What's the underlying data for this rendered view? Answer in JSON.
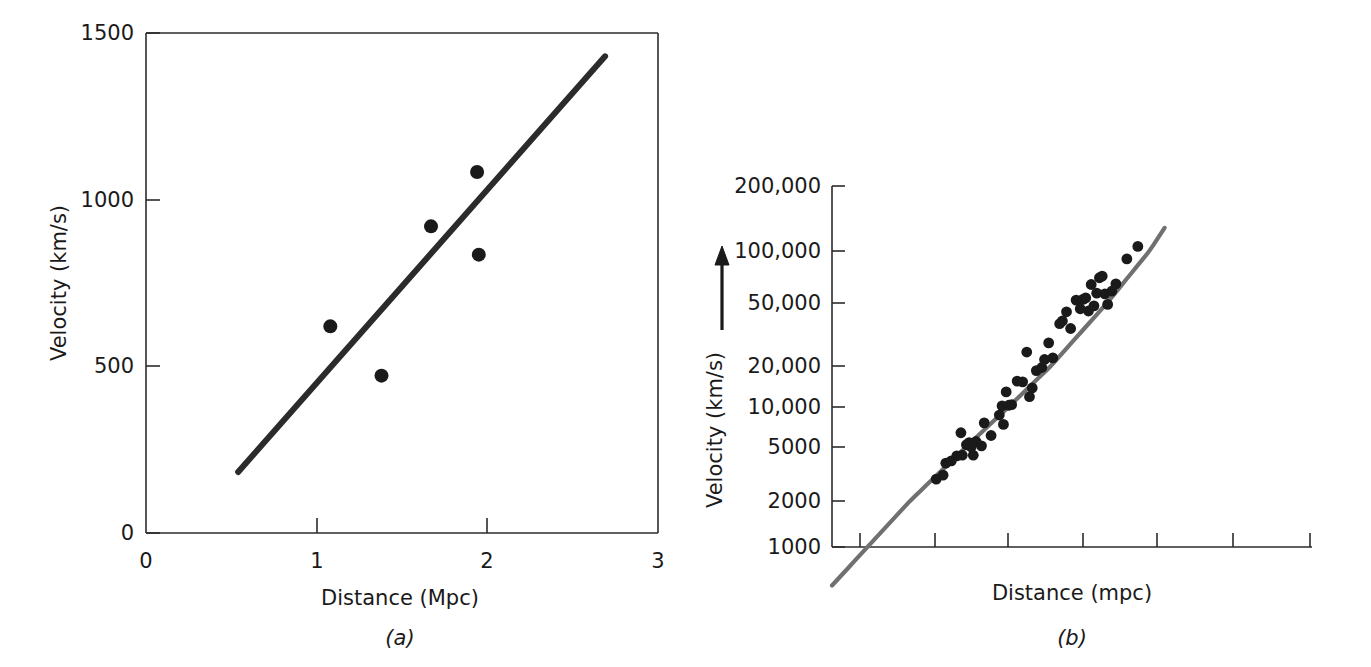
{
  "figure": {
    "background_color": "#ffffff",
    "ink_color": "#1a1a1a",
    "axis_color": "#2b2b2b"
  },
  "panel_a": {
    "caption": "(a)",
    "xlabel": "Distance (Mpc)",
    "ylabel": "Velocity (km/s)",
    "x_ticks": [
      "0",
      "1",
      "2",
      "3"
    ],
    "y_ticks": [
      "0",
      "500",
      "1000",
      "1500"
    ],
    "point_color": "#1a1a1a",
    "line_color": "#2b2b2b"
  },
  "panel_b": {
    "caption": "(b)",
    "xlabel": "Distance (mpc)",
    "ylabel": "Velocity (km/s)",
    "y_ticks": [
      "1000",
      "2000",
      "5000",
      "10,000",
      "20,000",
      "50,000",
      "100,000",
      "200,000"
    ],
    "x_ticks": [
      "",
      "",
      "",
      "",
      "",
      "",
      ""
    ],
    "point_color": "#1a1a1a",
    "line_color": "#707070",
    "arrow_label": "up-arrow"
  },
  "chart_data": [
    {
      "type": "scatter",
      "panel": "a",
      "title": "",
      "xlabel": "Distance (Mpc)",
      "ylabel": "Velocity (km/s)",
      "xlim": [
        0,
        3
      ],
      "ylim": [
        0,
        1500
      ],
      "xscale": "linear",
      "yscale": "linear",
      "xticks": [
        0,
        1,
        2,
        3
      ],
      "yticks": [
        0,
        500,
        1000,
        1500
      ],
      "grid": false,
      "legend": "none",
      "points": [
        {
          "x": 1.08,
          "y": 620
        },
        {
          "x": 1.38,
          "y": 472
        },
        {
          "x": 1.67,
          "y": 920
        },
        {
          "x": 1.94,
          "y": 1083
        },
        {
          "x": 1.95,
          "y": 835
        }
      ],
      "fit_line": {
        "x_start": 0.54,
        "y_start": 183,
        "x_end": 2.69,
        "y_end": 1430,
        "slope": 580,
        "note": "best-fit Hubble law line"
      }
    },
    {
      "type": "scatter",
      "panel": "b",
      "title": "",
      "xlabel": "Distance (mpc)",
      "ylabel": "Velocity (km/s)",
      "xlim": [
        0,
        7
      ],
      "ylim": [
        500,
        200000
      ],
      "xscale": "linear",
      "yscale": "log",
      "xticks": [
        1,
        2,
        3,
        4,
        5,
        6,
        7
      ],
      "xticklabels": [
        "",
        "",
        "",
        "",
        "",
        "",
        ""
      ],
      "yticks": [
        1000,
        2000,
        5000,
        10000,
        20000,
        50000,
        100000,
        200000
      ],
      "yticklabels": [
        "1000",
        "2000",
        "5000",
        "10,000",
        "20,000",
        "50,000",
        "100,000",
        "200,000"
      ],
      "grid": false,
      "legend": "none",
      "points": [
        {
          "x": 1.52,
          "y": 2900
        },
        {
          "x": 1.62,
          "y": 3100
        },
        {
          "x": 1.66,
          "y": 3800
        },
        {
          "x": 1.74,
          "y": 3950
        },
        {
          "x": 1.82,
          "y": 4300
        },
        {
          "x": 1.88,
          "y": 6400
        },
        {
          "x": 1.9,
          "y": 4350
        },
        {
          "x": 1.96,
          "y": 5200
        },
        {
          "x": 2.0,
          "y": 5400
        },
        {
          "x": 2.03,
          "y": 5000
        },
        {
          "x": 2.06,
          "y": 4350
        },
        {
          "x": 2.1,
          "y": 5500
        },
        {
          "x": 2.18,
          "y": 5100
        },
        {
          "x": 2.22,
          "y": 7600
        },
        {
          "x": 2.32,
          "y": 6100
        },
        {
          "x": 2.44,
          "y": 8700
        },
        {
          "x": 2.48,
          "y": 10200
        },
        {
          "x": 2.5,
          "y": 7400
        },
        {
          "x": 2.54,
          "y": 12900
        },
        {
          "x": 2.58,
          "y": 10300
        },
        {
          "x": 2.62,
          "y": 10400
        },
        {
          "x": 2.7,
          "y": 15500
        },
        {
          "x": 2.78,
          "y": 15300
        },
        {
          "x": 2.84,
          "y": 24500
        },
        {
          "x": 2.88,
          "y": 11900
        },
        {
          "x": 2.92,
          "y": 13800
        },
        {
          "x": 2.98,
          "y": 18500
        },
        {
          "x": 3.06,
          "y": 19500
        },
        {
          "x": 3.1,
          "y": 22000
        },
        {
          "x": 3.16,
          "y": 28000
        },
        {
          "x": 3.22,
          "y": 22500
        },
        {
          "x": 3.32,
          "y": 37000
        },
        {
          "x": 3.36,
          "y": 38500
        },
        {
          "x": 3.42,
          "y": 44000
        },
        {
          "x": 3.48,
          "y": 34500
        },
        {
          "x": 3.56,
          "y": 52000
        },
        {
          "x": 3.62,
          "y": 46000
        },
        {
          "x": 3.66,
          "y": 52500
        },
        {
          "x": 3.7,
          "y": 53500
        },
        {
          "x": 3.74,
          "y": 44500
        },
        {
          "x": 3.78,
          "y": 64000
        },
        {
          "x": 3.82,
          "y": 48000
        },
        {
          "x": 3.86,
          "y": 57000
        },
        {
          "x": 3.9,
          "y": 70000
        },
        {
          "x": 3.94,
          "y": 71500
        },
        {
          "x": 3.98,
          "y": 56500
        },
        {
          "x": 4.02,
          "y": 49000
        },
        {
          "x": 4.08,
          "y": 58500
        },
        {
          "x": 4.14,
          "y": 64500
        },
        {
          "x": 4.3,
          "y": 90000
        },
        {
          "x": 4.46,
          "y": 105000
        }
      ],
      "fit_line": {
        "note": "linear Hubble relation plotted on log velocity axis",
        "x_start": 0.0,
        "y_start": 560,
        "x_end": 4.85,
        "y_end": 128000
      }
    }
  ]
}
